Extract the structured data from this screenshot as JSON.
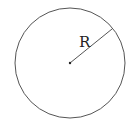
{
  "diagram": {
    "type": "circle-radius",
    "radius_label": "R",
    "colors": {
      "stroke": "#555555",
      "text": "#222222",
      "background": "#ffffff"
    },
    "geometry": {
      "center": [
        70,
        63
      ],
      "radius": 55,
      "radius_endpoint": [
        112,
        29
      ],
      "label_position": [
        79,
        46
      ]
    }
  }
}
